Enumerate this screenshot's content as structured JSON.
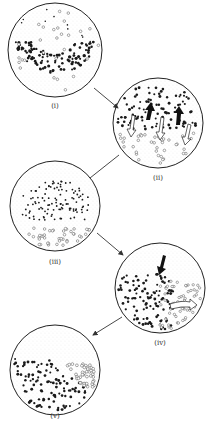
{
  "diagram": {
    "type": "sequential-stage-diagram",
    "stages": [
      {
        "id": "i",
        "label": "(i)",
        "cx": 55,
        "cy": 50,
        "r": 47,
        "description": "Mixed particles: dark dots in a U-shaped band, hollow circles scattered around, stippled background"
      },
      {
        "id": "ii",
        "label": "(ii)",
        "cx": 158,
        "cy": 123,
        "r": 45,
        "description": "Dark dots in upper region with black upward arrows; hollow circles in lower region with white downward arrows"
      },
      {
        "id": "iii",
        "label": "(iii)",
        "cx": 55,
        "cy": 206,
        "r": 45,
        "description": "Dark dots form a dome in the middle; hollow circles settled at the bottom; stippled top"
      },
      {
        "id": "iv",
        "label": "(iv)",
        "cx": 160,
        "cy": 288,
        "r": 45,
        "description": "Black arrow pushing down into dark dots; white curved arrow moving hollow circles to lower right"
      },
      {
        "id": "v",
        "label": "(v)",
        "cx": 55,
        "cy": 370,
        "r": 45,
        "description": "Dark dots on lower left, hollow circles on lower right, stippled top"
      }
    ],
    "connectors": [
      {
        "from": "i",
        "to": "ii",
        "label": "arrow"
      },
      {
        "from": "ii",
        "to": "iii",
        "label": "line"
      },
      {
        "from": "iii",
        "to": "iv",
        "label": "arrow"
      },
      {
        "from": "iv",
        "to": "v",
        "label": "arrow"
      }
    ],
    "colors": {
      "outline": "#222222",
      "dot": "#1a1a1a",
      "hollow": "#555555",
      "stipple": "#bdbdbd",
      "background": "#ffffff"
    }
  }
}
